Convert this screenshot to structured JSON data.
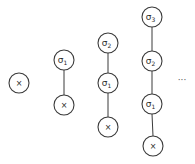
{
  "diagram": {
    "type": "chain-sequence",
    "node_radius": 10,
    "stroke_color": "#3a3a3a",
    "columns": [
      {
        "nodes": [
          {
            "base": "x",
            "sub": "",
            "cx": 19,
            "cy": 83
          }
        ]
      },
      {
        "nodes": [
          {
            "base": "σ",
            "sub": "1",
            "cx": 64,
            "cy": 60
          },
          {
            "base": "x",
            "sub": "",
            "cx": 64,
            "cy": 105
          }
        ]
      },
      {
        "nodes": [
          {
            "base": "σ",
            "sub": "2",
            "cx": 108,
            "cy": 43
          },
          {
            "base": "σ",
            "sub": "1",
            "cx": 108,
            "cy": 83
          },
          {
            "base": "x",
            "sub": "",
            "cx": 108,
            "cy": 127
          }
        ]
      },
      {
        "nodes": [
          {
            "base": "σ",
            "sub": "3",
            "cx": 152,
            "cy": 17
          },
          {
            "base": "σ",
            "sub": "2",
            "cx": 152,
            "cy": 61
          },
          {
            "base": "σ",
            "sub": "1",
            "cx": 152,
            "cy": 104
          },
          {
            "base": "x",
            "sub": "",
            "cx": 153,
            "cy": 146
          }
        ]
      }
    ],
    "ellipsis": {
      "text": "···",
      "x": 182,
      "y": 83
    }
  }
}
